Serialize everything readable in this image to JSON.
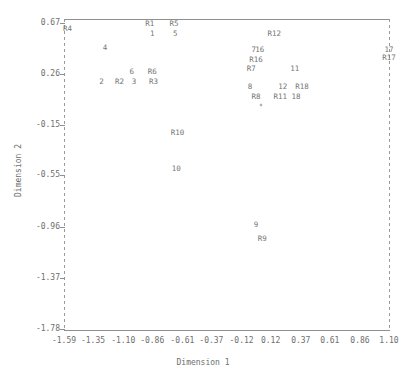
{
  "chart_data": {
    "type": "scatter",
    "title": "",
    "xlabel": "Dimension 1",
    "ylabel": "Dimension 2",
    "xlim": [
      -1.59,
      1.1
    ],
    "ylim": [
      -1.98,
      0.67
    ],
    "grid": false,
    "legend": null,
    "xticks": [
      "-1.59",
      "-1.35",
      "-1.10",
      "-0.86",
      "-0.61",
      "-0.37",
      "-0.12",
      "0.12",
      "0.37",
      "0.61",
      "0.86",
      "1.10"
    ],
    "xtick_values": [
      -1.59,
      -1.35,
      -1.1,
      -0.86,
      -0.61,
      -0.37,
      -0.12,
      0.12,
      0.37,
      0.61,
      0.86,
      1.1
    ],
    "yticks": [
      "0.67",
      "0.26",
      "-0.15",
      "-0.55",
      "-0.96",
      "-1.37",
      "-1.78"
    ],
    "ytick_values": [
      0.67,
      0.26,
      -0.15,
      -0.55,
      -0.96,
      -1.37,
      -1.78
    ],
    "points": [
      {
        "label": "R4",
        "x": -1.56,
        "y": 0.62
      },
      {
        "label": "R1",
        "x": -0.88,
        "y": 0.665
      },
      {
        "label": "R5",
        "x": -0.68,
        "y": 0.665
      },
      {
        "label": "1",
        "x": -0.86,
        "y": 0.585
      },
      {
        "label": "5",
        "x": -0.67,
        "y": 0.585
      },
      {
        "label": "4",
        "x": -1.25,
        "y": 0.47
      },
      {
        "label": "R12",
        "x": 0.15,
        "y": 0.585
      },
      {
        "label": "7",
        "x": -0.02,
        "y": 0.455
      },
      {
        "label": "16",
        "x": 0.03,
        "y": 0.455
      },
      {
        "label": "17",
        "x": 1.1,
        "y": 0.455
      },
      {
        "label": "R17",
        "x": 1.1,
        "y": 0.39
      },
      {
        "label": "R16",
        "x": 0.0,
        "y": 0.375
      },
      {
        "label": "11",
        "x": 0.32,
        "y": 0.3
      },
      {
        "label": "6",
        "x": -1.03,
        "y": 0.275
      },
      {
        "label": "R6",
        "x": -0.86,
        "y": 0.275
      },
      {
        "label": "R7",
        "x": -0.04,
        "y": 0.3
      },
      {
        "label": "2",
        "x": -1.28,
        "y": 0.195
      },
      {
        "label": "R2",
        "x": -1.13,
        "y": 0.195
      },
      {
        "label": "3",
        "x": -1.01,
        "y": 0.195
      },
      {
        "label": "R3",
        "x": -0.85,
        "y": 0.195
      },
      {
        "label": "8",
        "x": -0.05,
        "y": 0.155
      },
      {
        "label": "12",
        "x": 0.22,
        "y": 0.155
      },
      {
        "label": "R18",
        "x": 0.38,
        "y": 0.155
      },
      {
        "label": "R8",
        "x": 0.0,
        "y": 0.075
      },
      {
        "label": "R11",
        "x": 0.2,
        "y": 0.075
      },
      {
        "label": "18",
        "x": 0.33,
        "y": 0.075
      },
      {
        "label": "R10",
        "x": -0.65,
        "y": -0.21
      },
      {
        "label": "10",
        "x": -0.66,
        "y": -0.5
      },
      {
        "label": "9",
        "x": 0.0,
        "y": -0.95
      },
      {
        "label": "R9",
        "x": 0.05,
        "y": -1.06
      }
    ],
    "markers": [
      {
        "x": 0.04,
        "y": 0.01
      }
    ]
  }
}
